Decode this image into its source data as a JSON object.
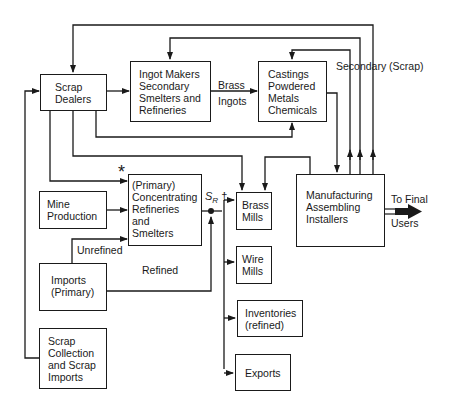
{
  "nodes": {
    "scrap_dealers": {
      "label": "Scrap\nDealers"
    },
    "ingot_makers": {
      "label": "Ingot Makers\nSecondary\nSmelters and\nRefineries"
    },
    "castings": {
      "label": "Castings\nPowdered\nMetals\nChemicals"
    },
    "primary": {
      "label": "(Primary)\nConcentrating\nRefineries\nand\nSmelters"
    },
    "mine_production": {
      "label": "Mine\nProduction"
    },
    "imports": {
      "label": "Imports\n(Primary)"
    },
    "scrap_collection": {
      "label": "Scrap\nCollection\nand Scrap\nImports"
    },
    "brass_mills": {
      "label": "Brass\nMills"
    },
    "wire_mills": {
      "label": "Wire\nMills"
    },
    "inventories": {
      "label": "Inventories\n(refined)"
    },
    "exports": {
      "label": "Exports"
    },
    "manufacturing": {
      "label": "Manufacturing\nAssembling\nInstallers"
    }
  },
  "edge_labels": {
    "brass": "Brass",
    "ingots": "Ingots",
    "secondary_scrap": "Secondary (Scrap)",
    "to_final": "To Final",
    "users": "Users",
    "unrefined": "Unrefined",
    "refined": "Refined",
    "asterisk": "*",
    "sr_main": "S",
    "sr_sub": "R",
    "dagger": "†"
  }
}
